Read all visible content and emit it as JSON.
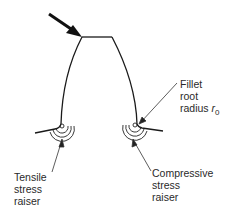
{
  "diagram": {
    "labels": {
      "fillet": [
        "Fillet",
        "root",
        "radius"
      ],
      "fillet_symbol": "r",
      "fillet_subscript": "0",
      "tensile": [
        "Tensile",
        "stress",
        "raiser"
      ],
      "compressive": [
        "Compressive",
        "stress",
        "raiser"
      ]
    },
    "elements": [
      "load-arrow",
      "tooth-profile",
      "left-fillet-stress-contours",
      "right-fillet-stress-contours"
    ],
    "colors": {
      "line": "#1a1a1a",
      "background": "#ffffff"
    }
  }
}
